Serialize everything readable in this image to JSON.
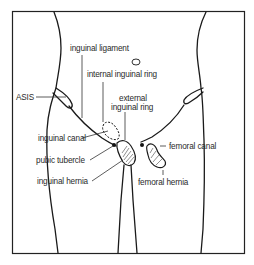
{
  "figure": {
    "labels": {
      "inguinal_ligament": "inguinal ligament",
      "internal_inguinal_ring": "internal inguinal ring",
      "external_inguinal_ring_line1": "external",
      "external_inguinal_ring_line2": "inguinal ring",
      "asis": "ASIS",
      "inguinal_canal": "inguinal canal",
      "pubic_tubercle": "pubic tubercle",
      "inguinal_hernia": "inguinal hernia",
      "femoral_canal": "femoral canal",
      "femoral_hernia": "femoral hernia"
    },
    "colors": {
      "line": "#1a1a1a",
      "text": "#2a2a2a",
      "background": "#ffffff"
    }
  }
}
